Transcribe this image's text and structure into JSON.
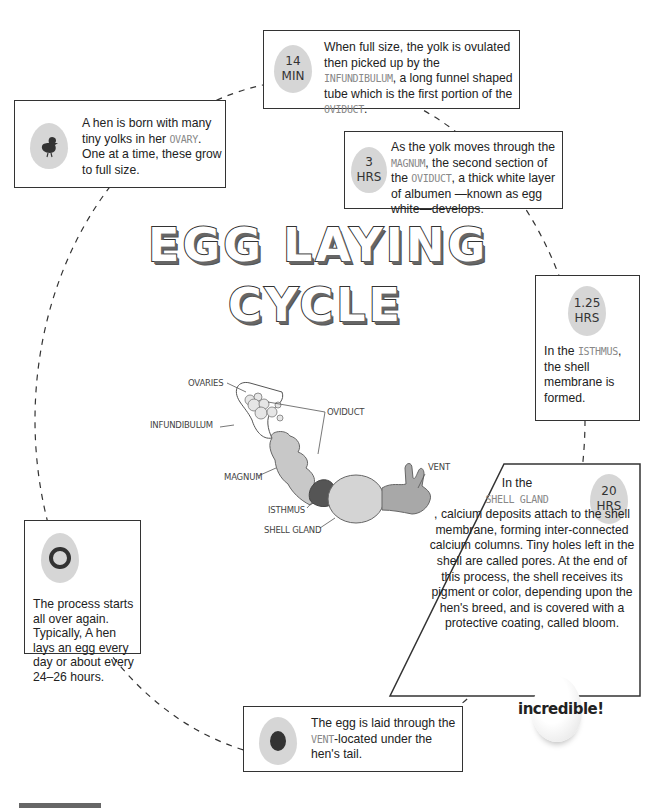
{
  "title": {
    "line1": "EGG LAYING",
    "line2": "CYCLE"
  },
  "steps": [
    {
      "id": "ovary",
      "icon": "chick-icon",
      "text_before": "A hen is born with many tiny yolks in her ",
      "highlight": "OVARY",
      "text_after": ". One at a time, these grow to full size."
    },
    {
      "id": "infundibulum",
      "time_num": "14",
      "time_unit": "MIN",
      "text_before": "When full size, the yolk is ovulated then picked up by the ",
      "highlight": "INFUNDIBULUM",
      "text_mid": ", a long funnel shaped tube which is the first portion of the ",
      "highlight2": "OVIDUCT",
      "text_after": "."
    },
    {
      "id": "magnum",
      "time_num": "3",
      "time_unit": "HRS",
      "text_before": "As the yolk moves through the ",
      "highlight": "MAGNUM",
      "text_mid": ", the second section of the ",
      "highlight2": "OVIDUCT",
      "text_after": ", a thick white layer of albumen —known as egg white—develops."
    },
    {
      "id": "isthmus",
      "time_num": "1.25",
      "time_unit": "HRS",
      "text_before": "In the ",
      "highlight": "ISTHMUS",
      "text_after": ", the shell membrane is formed."
    },
    {
      "id": "shell-gland",
      "time_num": "20",
      "time_unit": "HRS",
      "text_before": "In the ",
      "highlight": "SHELL GLAND",
      "text_after": ", calcium deposits attach to the shell membrane, forming inter-connected calcium columns. Tiny holes left in the shell are called pores. At the end of this process, the shell receives its pigment or color, depending upon the hen's breed, and is covered with a protective coating, called bloom."
    },
    {
      "id": "vent",
      "icon": "egg-yolk-icon",
      "text_before": "The egg is laid through the ",
      "highlight": "VENT",
      "text_after": "-located under the hen's tail."
    },
    {
      "id": "repeat",
      "icon": "cycle-arrows-icon",
      "text_before": "The process starts all over again. Typically, A hen lays an egg every day or about every 24–26 hours."
    }
  ],
  "anatomy_labels": {
    "ovaries": "OVARIES",
    "infundibulum": "INFUNDIBULUM",
    "oviduct": "OVIDUCT",
    "magnum": "MAGNUM",
    "isthmus": "ISTHMUS",
    "shell_gland": "SHELL GLAND",
    "vent": "VENT"
  },
  "badge": {
    "text": "incredible!"
  },
  "colors": {
    "egg_fill": "#d6d6d6",
    "highlight_text": "#888888",
    "organ_light": "#c8c8c8",
    "organ_dark": "#555555",
    "border": "#333333"
  }
}
